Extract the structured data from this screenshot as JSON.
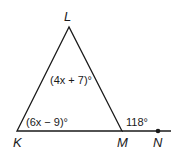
{
  "figure": {
    "points": {
      "L": {
        "label": "L",
        "x": 69,
        "y": 27
      },
      "K": {
        "label": "K",
        "x": 17,
        "y": 131
      },
      "M": {
        "label": "M",
        "x": 122,
        "y": 131
      },
      "N": {
        "label": "N",
        "x": 158,
        "y": 131
      }
    },
    "angles": {
      "L": {
        "label": "(4x + 7)°"
      },
      "K": {
        "label": "(6x − 9)°"
      },
      "exterior_M": {
        "label": "118°"
      }
    },
    "colors": {
      "stroke": "#1a1a1a"
    }
  }
}
